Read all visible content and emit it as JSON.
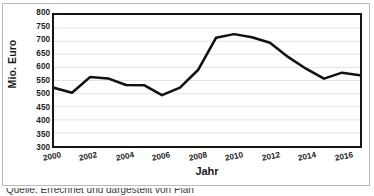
{
  "chart_data": {
    "type": "line",
    "title": "",
    "xlabel": "Jahr",
    "ylabel": "Mio. Euro",
    "xlim": [
      2000,
      2017
    ],
    "ylim": [
      300,
      800
    ],
    "grid": true,
    "legend": "none",
    "x": [
      2000,
      2001,
      2002,
      2003,
      2004,
      2005,
      2006,
      2007,
      2008,
      2009,
      2010,
      2011,
      2012,
      2013,
      2014,
      2015,
      2016,
      2017
    ],
    "values": [
      522,
      503,
      563,
      558,
      533,
      532,
      494,
      523,
      590,
      713,
      727,
      715,
      694,
      640,
      595,
      557,
      580,
      570
    ],
    "series": [
      {
        "name": "Mio. Euro",
        "color": "#111111",
        "values": [
          522,
          503,
          563,
          558,
          533,
          532,
          494,
          523,
          590,
          713,
          727,
          715,
          694,
          640,
          595,
          557,
          580,
          570
        ]
      }
    ],
    "y_ticks": [
      800,
      750,
      700,
      650,
      600,
      550,
      500,
      450,
      400,
      350,
      300
    ],
    "x_ticks": [
      2000,
      2002,
      2004,
      2006,
      2008,
      2010,
      2012,
      2014,
      2016
    ],
    "line_color": "#111111",
    "line_width": 2.6,
    "gridline_color": "#e2e2e2",
    "axis_color": "#151515",
    "background": "#ffffff"
  },
  "caption": {
    "text": "Quelle: Errechnet und dargestellt von Plan"
  }
}
